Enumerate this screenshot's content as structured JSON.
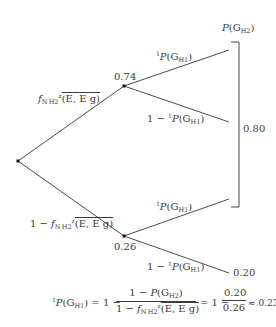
{
  "tree": {
    "node_upper_value": "0.74",
    "node_lower_value": "0.26",
    "root_upper_branch_label": {
      "prefix": "",
      "f": "f",
      "f_sub": "N H2",
      "sup": "z",
      "args": "(E, E g)"
    },
    "root_lower_branch_label": {
      "prefix": "1 − ",
      "f": "f",
      "f_sub": "N H2",
      "sup": "z",
      "args": "(E, E g)"
    },
    "upper_upper_branch_label": {
      "sup": "1",
      "P": "P",
      "G": "(G",
      "G_sub": "H1",
      "close": ")"
    },
    "upper_lower_branch_label": {
      "prefix": "1 − ",
      "sup": "1",
      "P": "P",
      "G": "(G",
      "G_sub": "H1",
      "close": ")"
    },
    "lower_upper_branch_label": {
      "sup": "1",
      "P": "P",
      "G": "(G",
      "G_sub": "H1",
      "close": ")"
    },
    "lower_lower_branch_label": {
      "prefix": "1 − ",
      "sup": "1",
      "P": "P",
      "G": "(G",
      "G_sub": "H1",
      "close": ")"
    },
    "bracket_top_label": {
      "P": "P",
      "G": "(G",
      "G_sub": "H2",
      "close": ")"
    },
    "bracket_value": "0.80",
    "lower_lower_leaf_value": "0.20"
  },
  "formula": {
    "lhs_sup": "1",
    "lhs_P": "P",
    "lhs_G": "(G",
    "lhs_G_sub": "H1",
    "lhs_close": ")",
    "eq1": " = 1 − ",
    "frac1_num": {
      "prefix": "1 − ",
      "P": "P",
      "G": "(G",
      "G_sub": "H2",
      "close": ")"
    },
    "frac1_den": {
      "prefix": "1 − ",
      "f": "f",
      "f_sub": "N H2",
      "sup": "z",
      "args": "(E, E g)"
    },
    "eq2": "= 1 −",
    "frac2_num": "0.20",
    "frac2_den": "0.26",
    "approx": "≈ 0.23"
  }
}
